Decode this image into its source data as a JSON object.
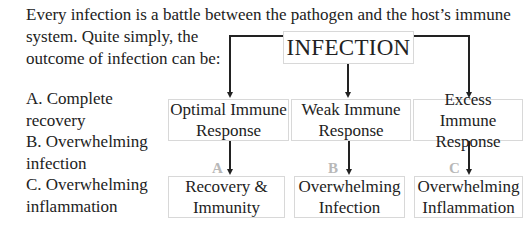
{
  "intro": {
    "line1": "Every infection is a battle between the pathogen and the host’s immune",
    "line2": "system. Quite simply, the",
    "line3": "outcome of infection can be:"
  },
  "outcomes": [
    {
      "line1": "A. Complete",
      "line2": "recovery"
    },
    {
      "line1": "B. Overwhelming",
      "line2": "infection"
    },
    {
      "line1": "C. Overwhelming",
      "line2": "inflammation"
    }
  ],
  "diagram": {
    "root": "INFECTION",
    "responses": [
      {
        "line1": "Optimal Immune",
        "line2": "Response"
      },
      {
        "line1": "Weak Immune",
        "line2": "Response"
      },
      {
        "line1": "Excess Immune",
        "line2": "Response"
      }
    ],
    "letters": [
      "A",
      "B",
      "C"
    ],
    "results": [
      {
        "line1": "Recovery &",
        "line2": "Immunity"
      },
      {
        "line1": "Overwhelming",
        "line2": "Infection"
      },
      {
        "line1": "Overwhelming",
        "line2": "Inflammation"
      }
    ]
  }
}
